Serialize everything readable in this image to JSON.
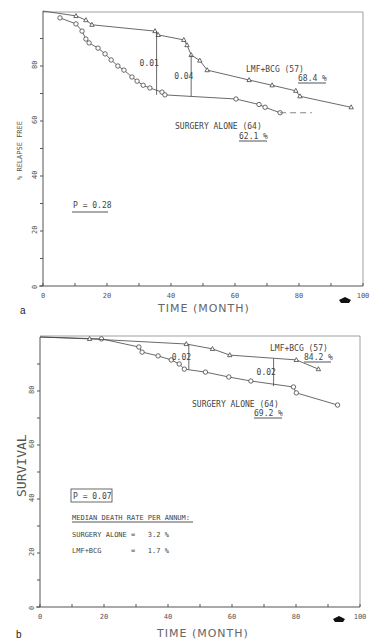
{
  "chart_data": [
    {
      "panel": "a",
      "type": "line",
      "title": "",
      "xlabel": "TIME (MONTH)",
      "ylabel": "% RELAPSE FREE",
      "xlim": [
        0,
        100
      ],
      "ylim": [
        0,
        100
      ],
      "xticks": [
        0,
        20,
        40,
        60,
        80,
        100
      ],
      "yticks": [
        0,
        20,
        40,
        60,
        80
      ],
      "grid": false,
      "series": [
        {
          "name": "LMF+BCG (57)",
          "marker": "triangle",
          "final_label": "68.4 %",
          "x": [
            0,
            10.3,
            13.4,
            15.3,
            35.0,
            36.0,
            44.0,
            45.0,
            46.3,
            49.0,
            51.3,
            64.4,
            71.6,
            79.0,
            80.3,
            96.3
          ],
          "y": [
            100,
            98.2,
            96.7,
            95.0,
            92.7,
            91.3,
            89.5,
            87.6,
            84.0,
            82.0,
            78.5,
            74.9,
            73.0,
            71.0,
            69.0,
            65.0
          ]
        },
        {
          "name": "SURGERY ALONE (64)",
          "marker": "circle",
          "final_label": "62.1 %",
          "x": [
            5.3,
            10.3,
            12.2,
            13.4,
            14.4,
            17.2,
            19.4,
            21.3,
            23.4,
            25.3,
            27.8,
            29.4,
            31.3,
            33.4,
            37.2,
            38.1,
            60.3,
            67.5,
            69.4,
            74.1
          ],
          "y": [
            97.5,
            95.3,
            92.7,
            89.8,
            88.4,
            86.5,
            84.4,
            82.2,
            80.0,
            78.5,
            76.0,
            74.5,
            73.0,
            72.0,
            70.5,
            69.5,
            68.0,
            66.0,
            65.0,
            63.0
          ],
          "dashed_extension": {
            "x": [
              74.1,
              84.0
            ],
            "y": [
              63.0,
              63.0
            ]
          }
        }
      ],
      "annotations": [
        {
          "text": "0.01",
          "x": 35.5,
          "y_from": 69.5,
          "y_to": 92.7
        },
        {
          "text": "0.04",
          "x": 46.3,
          "y_from": 69.0,
          "y_to": 84.0
        },
        {
          "text": "P = 0.28",
          "x": 9,
          "y": 30,
          "style": "underlined"
        }
      ],
      "panel_label": "a"
    },
    {
      "panel": "b",
      "type": "line",
      "title": "",
      "xlabel": "TIME (MONTH)",
      "ylabel": "SURVIVAL",
      "xlim": [
        0,
        100
      ],
      "ylim": [
        0,
        100
      ],
      "xticks": [
        0,
        20,
        40,
        60,
        80,
        100
      ],
      "yticks": [
        0,
        20,
        40,
        60,
        80
      ],
      "grid": false,
      "series": [
        {
          "name": "LMF+BCG (57)",
          "marker": "triangle",
          "final_label": "84.2 %",
          "x": [
            0,
            15.5,
            45.7,
            53.9,
            59.3,
            80.1,
            87.0
          ],
          "y": [
            100,
            99.3,
            97.4,
            95.6,
            93.3,
            91.5,
            88.1
          ]
        },
        {
          "name": "SURGERY ALONE (64)",
          "marker": "circle",
          "final_label": "69.2 %",
          "x": [
            0,
            19.2,
            30.9,
            31.9,
            36.9,
            41.0,
            43.5,
            45.1,
            51.7,
            59.0,
            65.9,
            79.2,
            80.1,
            93.0
          ],
          "y": [
            100,
            99.3,
            96.3,
            94.4,
            93.0,
            91.5,
            90.0,
            88.1,
            87.0,
            85.2,
            83.7,
            81.5,
            79.3,
            74.8
          ]
        }
      ],
      "annotations": [
        {
          "text": "0.02",
          "x": 46.5,
          "y_from": 88.0,
          "y_to": 97.2
        },
        {
          "text": "0.02",
          "x": 73.0,
          "y_from": 81.8,
          "y_to": 92.0
        },
        {
          "text": "P = 0.07",
          "x": 9,
          "y": 40,
          "style": "boxed"
        },
        {
          "text": "MEDIAN DEATH RATE PER ANNUM:",
          "style": "underlined"
        },
        {
          "text": "SURGERY ALONE =   3.2 %"
        },
        {
          "text": "LMF+BCG       =   1.7 %"
        }
      ],
      "panel_label": "b"
    }
  ],
  "labels": {
    "a": {
      "panel": "a",
      "ylabel": "% RELAPSE FREE",
      "xlabel": "TIME (MONTH)",
      "legend_lmf": "LMF+BCG (57)",
      "legend_lmf_pct": "68.4 %",
      "legend_surg": "SURGERY ALONE (64)",
      "legend_surg_pct": "62.1 %",
      "p_value": "P = 0.28",
      "diff1": "0.01",
      "diff2": "0.04"
    },
    "b": {
      "panel": "b",
      "ylabel": "SURVIVAL",
      "xlabel": "TIME (MONTH)",
      "legend_lmf": "LMF+BCG (57)",
      "legend_lmf_pct": "84.2 %",
      "legend_surg": "SURGERY ALONE (64)",
      "legend_surg_pct": "69.2 %",
      "p_value": "P = 0.07",
      "diff1": "0.02",
      "diff2": "0.02",
      "median_title": "MEDIAN DEATH RATE PER ANNUM:",
      "median_surg": "SURGERY ALONE =   3.2 %",
      "median_lmf": "LMF+BCG       =   1.7 %"
    },
    "xticks": [
      "0",
      "20",
      "40",
      "60",
      "80",
      "100"
    ],
    "yticks": [
      "0",
      "20",
      "40",
      "60",
      "80"
    ]
  }
}
